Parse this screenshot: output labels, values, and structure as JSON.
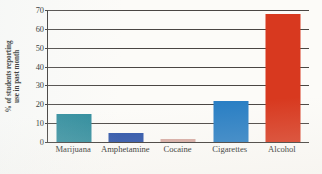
{
  "chart_data": {
    "type": "bar",
    "title": "",
    "xlabel": "",
    "ylabel": "% of students reporting use in past month",
    "ylabel_line1": "% of students reporting",
    "ylabel_line2": "use in past month",
    "categories": [
      "Marijuana",
      "Amphetamine",
      "Cocaine",
      "Cigarettes",
      "Alcohol"
    ],
    "values": [
      15,
      5,
      1.5,
      22,
      68
    ],
    "ylim": [
      0,
      70
    ],
    "yticks": [
      0,
      10,
      20,
      30,
      40,
      50,
      60,
      70
    ],
    "ytick_labels": [
      "0",
      "10",
      "20",
      "30",
      "40",
      "50",
      "60",
      "70"
    ],
    "grid": true,
    "legend": "none",
    "bar_colors": [
      "#2d8b9b",
      "#2b52a8",
      "#d6a9a1",
      "#2a7fc4",
      "#d8391f"
    ],
    "series": [
      {
        "name": "% of students reporting use in past month",
        "values": [
          15,
          5,
          1.5,
          22,
          68
        ]
      }
    ]
  },
  "axes": {
    "y_axis_color": "#3a3633",
    "gridline_color": "#4a4643",
    "background": "#fcfbf8"
  }
}
